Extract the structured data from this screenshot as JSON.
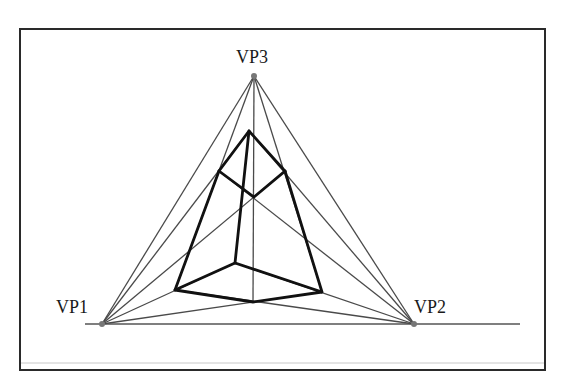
{
  "diagram": {
    "labels": {
      "vp1": "VP1",
      "vp2": "VP2",
      "vp3": "VP3"
    },
    "colors": {
      "frame": "#2a2a2a",
      "construction_lines": "#4a4a4a",
      "cube_edges": "#111111",
      "vanishing_points": "#777777"
    },
    "vanishing_points": {
      "vp1": [
        102,
        324
      ],
      "vp2": [
        414,
        324
      ],
      "vp3": [
        254,
        76
      ]
    },
    "horizon": {
      "x1": 85,
      "x2": 520,
      "y": 324
    },
    "cube_vertices": {
      "top": [
        249,
        131
      ],
      "top_left": [
        219,
        171
      ],
      "top_right": [
        285,
        171
      ],
      "top_center": [
        254,
        197
      ],
      "bottom_left": [
        175,
        290
      ],
      "bottom_hidden": [
        235,
        263
      ],
      "bottom_right": [
        322,
        292
      ],
      "bottom_front": [
        253,
        302
      ]
    }
  }
}
